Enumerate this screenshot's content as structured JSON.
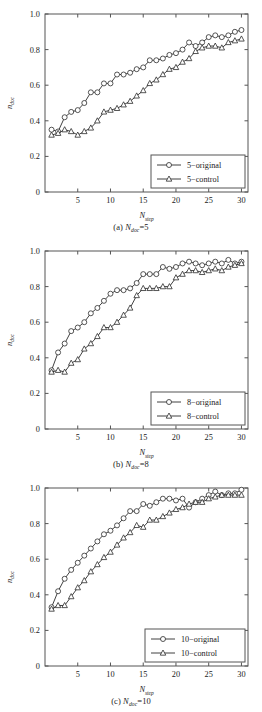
{
  "figure": {
    "background": "#ffffff",
    "line_color": "#2b2b2b",
    "marker_face": "#ffffff",
    "axis_color": "#555555"
  },
  "panels": [
    {
      "id": "panel-a",
      "caption_prefix": "(a) ",
      "caption_var": "N",
      "caption_sub": "doc",
      "caption_value": "=5",
      "xlabel_main": "N",
      "xlabel_sub": "step",
      "ylabel_main": "n",
      "ylabel_sub": "doc",
      "xticks": [
        "5",
        "10",
        "15",
        "20",
        "25",
        "30"
      ],
      "yticks": [
        "0",
        "0.2",
        "0.4",
        "0.6",
        "0.8",
        "1.0"
      ],
      "legend": [
        {
          "label": "5−original",
          "marker": "circle"
        },
        {
          "label": "5−control",
          "marker": "triangle"
        }
      ]
    },
    {
      "id": "panel-b",
      "caption_prefix": "(b) ",
      "caption_var": "N",
      "caption_sub": "doc",
      "caption_value": "=8",
      "xlabel_main": "N",
      "xlabel_sub": "step",
      "ylabel_main": "n",
      "ylabel_sub": "doc",
      "xticks": [
        "5",
        "10",
        "15",
        "20",
        "25",
        "30"
      ],
      "yticks": [
        "0",
        "0.2",
        "0.4",
        "0.6",
        "0.8",
        "1.0"
      ],
      "legend": [
        {
          "label": "8−original",
          "marker": "circle"
        },
        {
          "label": "8−control",
          "marker": "triangle"
        }
      ]
    },
    {
      "id": "panel-c",
      "caption_prefix": "(c) ",
      "caption_var": "N",
      "caption_sub": "doc",
      "caption_value": "=10",
      "xlabel_main": "N",
      "xlabel_sub": "step",
      "ylabel_main": "n",
      "ylabel_sub": "doc",
      "xticks": [
        "5",
        "10",
        "15",
        "20",
        "25",
        "30"
      ],
      "yticks": [
        "0",
        "0.2",
        "0.4",
        "0.6",
        "0.8",
        "1.0"
      ],
      "legend": [
        {
          "label": "10−original",
          "marker": "circle"
        },
        {
          "label": "10−control",
          "marker": "triangle"
        }
      ]
    }
  ],
  "chart_data": [
    {
      "type": "line",
      "title": "(a) N_doc=5",
      "xlabel": "N_step",
      "ylabel": "n_doc",
      "xlim": [
        0,
        31
      ],
      "ylim": [
        0,
        1.0
      ],
      "xticks": [
        5,
        10,
        15,
        20,
        25,
        30
      ],
      "yticks": [
        0,
        0.2,
        0.4,
        0.6,
        0.8,
        1.0
      ],
      "grid": false,
      "legend_position": "lower-right",
      "x": [
        1,
        2,
        3,
        4,
        5,
        6,
        7,
        8,
        9,
        10,
        11,
        12,
        13,
        14,
        15,
        16,
        17,
        18,
        19,
        20,
        21,
        22,
        23,
        24,
        25,
        26,
        27,
        28,
        29,
        30
      ],
      "series": [
        {
          "name": "5−original",
          "marker": "circle",
          "values": [
            0.35,
            0.34,
            0.42,
            0.45,
            0.46,
            0.5,
            0.56,
            0.56,
            0.61,
            0.61,
            0.66,
            0.66,
            0.67,
            0.69,
            0.7,
            0.74,
            0.74,
            0.75,
            0.77,
            0.78,
            0.8,
            0.84,
            0.82,
            0.84,
            0.87,
            0.88,
            0.87,
            0.88,
            0.9,
            0.91
          ]
        },
        {
          "name": "5−control",
          "marker": "triangle",
          "values": [
            0.32,
            0.33,
            0.35,
            0.34,
            0.32,
            0.34,
            0.36,
            0.4,
            0.45,
            0.46,
            0.47,
            0.49,
            0.51,
            0.54,
            0.57,
            0.61,
            0.63,
            0.66,
            0.69,
            0.7,
            0.73,
            0.75,
            0.79,
            0.81,
            0.82,
            0.82,
            0.81,
            0.84,
            0.85,
            0.86
          ]
        }
      ]
    },
    {
      "type": "line",
      "title": "(b) N_doc=8",
      "xlabel": "N_step",
      "ylabel": "n_doc",
      "xlim": [
        0,
        31
      ],
      "ylim": [
        0,
        1.0
      ],
      "xticks": [
        5,
        10,
        15,
        20,
        25,
        30
      ],
      "yticks": [
        0,
        0.2,
        0.4,
        0.6,
        0.8,
        1.0
      ],
      "grid": false,
      "legend_position": "lower-right",
      "x": [
        1,
        2,
        3,
        4,
        5,
        6,
        7,
        8,
        9,
        10,
        11,
        12,
        13,
        14,
        15,
        16,
        17,
        18,
        19,
        20,
        21,
        22,
        23,
        24,
        25,
        26,
        27,
        28,
        29,
        30
      ],
      "series": [
        {
          "name": "8−original",
          "marker": "circle",
          "values": [
            0.33,
            0.43,
            0.48,
            0.55,
            0.57,
            0.6,
            0.65,
            0.68,
            0.72,
            0.76,
            0.78,
            0.78,
            0.79,
            0.82,
            0.87,
            0.87,
            0.87,
            0.91,
            0.9,
            0.91,
            0.93,
            0.94,
            0.93,
            0.92,
            0.93,
            0.94,
            0.93,
            0.95,
            0.93,
            0.94
          ]
        },
        {
          "name": "8−control",
          "marker": "triangle",
          "values": [
            0.32,
            0.33,
            0.32,
            0.37,
            0.39,
            0.45,
            0.48,
            0.52,
            0.57,
            0.57,
            0.6,
            0.64,
            0.68,
            0.75,
            0.79,
            0.79,
            0.79,
            0.8,
            0.8,
            0.85,
            0.87,
            0.89,
            0.89,
            0.88,
            0.89,
            0.9,
            0.89,
            0.91,
            0.92,
            0.93
          ]
        }
      ]
    },
    {
      "type": "line",
      "title": "(c) N_doc=10",
      "xlabel": "N_step",
      "ylabel": "n_doc",
      "xlim": [
        0,
        31
      ],
      "ylim": [
        0,
        1.0
      ],
      "xticks": [
        5,
        10,
        15,
        20,
        25,
        30
      ],
      "yticks": [
        0,
        0.2,
        0.4,
        0.6,
        0.8,
        1.0
      ],
      "grid": false,
      "legend_position": "lower-right",
      "x": [
        1,
        2,
        3,
        4,
        5,
        6,
        7,
        8,
        9,
        10,
        11,
        12,
        13,
        14,
        15,
        16,
        17,
        18,
        19,
        20,
        21,
        22,
        23,
        24,
        25,
        26,
        27,
        28,
        29,
        30
      ],
      "series": [
        {
          "name": "10−original",
          "marker": "circle",
          "values": [
            0.33,
            0.42,
            0.49,
            0.54,
            0.58,
            0.62,
            0.66,
            0.7,
            0.74,
            0.76,
            0.79,
            0.83,
            0.87,
            0.87,
            0.91,
            0.9,
            0.92,
            0.94,
            0.94,
            0.93,
            0.94,
            0.89,
            0.92,
            0.94,
            0.96,
            0.98,
            0.96,
            0.97,
            0.97,
            0.99
          ]
        },
        {
          "name": "10−control",
          "marker": "triangle",
          "values": [
            0.32,
            0.34,
            0.34,
            0.39,
            0.44,
            0.48,
            0.53,
            0.57,
            0.61,
            0.64,
            0.68,
            0.72,
            0.75,
            0.79,
            0.78,
            0.82,
            0.82,
            0.84,
            0.86,
            0.88,
            0.89,
            0.91,
            0.92,
            0.92,
            0.94,
            0.95,
            0.96,
            0.96,
            0.96,
            0.96
          ]
        }
      ]
    }
  ]
}
